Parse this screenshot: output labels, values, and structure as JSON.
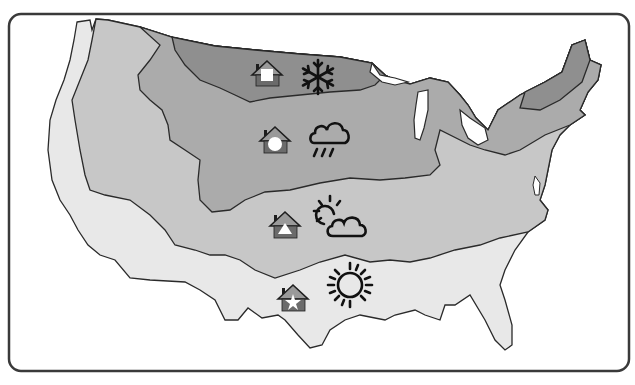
{
  "map": {
    "title": "United States climate zones",
    "colors": {
      "frame_border": "#3a3a3a",
      "background": "#ffffff",
      "outline": "#2a2a2a",
      "zone_cold": "#8f8f8f",
      "zone_cool": "#a9a9a9",
      "zone_mild": "#c6c6c6",
      "zone_warm": "#e6e6e6",
      "house_roof": "#9a9a9a",
      "house_base": "#6b6b6b",
      "house_outline": "#1e1e1e",
      "symbol_fill": "#ffffff",
      "weather_stroke": "#111111"
    },
    "zones": [
      {
        "id": "cold",
        "house_symbol": "square",
        "weather_icon": "snowflake-icon"
      },
      {
        "id": "cool",
        "house_symbol": "circle",
        "weather_icon": "rain-cloud-icon"
      },
      {
        "id": "mild",
        "house_symbol": "triangle",
        "weather_icon": "partly-sunny-icon"
      },
      {
        "id": "warm",
        "house_symbol": "star",
        "weather_icon": "sun-icon"
      }
    ]
  }
}
